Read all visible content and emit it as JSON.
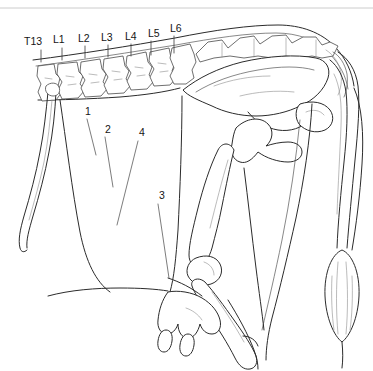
{
  "figure": {
    "background_color": "#ffffff",
    "line_color": "#2b2b2b",
    "width": 373,
    "height": 371
  },
  "vertebra_labels": [
    {
      "id": "t13",
      "text": "T13",
      "x": 24,
      "y": 45,
      "tick_x": 41,
      "tick_y1": 50,
      "tick_y2": 62
    },
    {
      "id": "l1",
      "text": "L1",
      "x": 53,
      "y": 43,
      "tick_x": 62,
      "tick_y1": 48,
      "tick_y2": 60
    },
    {
      "id": "l2",
      "text": "L2",
      "x": 78,
      "y": 42,
      "tick_x": 85,
      "tick_y1": 46,
      "tick_y2": 58
    },
    {
      "id": "l3",
      "text": "L3",
      "x": 101,
      "y": 41,
      "tick_x": 108,
      "tick_y1": 45,
      "tick_y2": 57
    },
    {
      "id": "l4",
      "text": "L4",
      "x": 125,
      "y": 40,
      "tick_x": 131,
      "tick_y1": 44,
      "tick_y2": 56
    },
    {
      "id": "l5",
      "text": "L5",
      "x": 148,
      "y": 37,
      "tick_x": 151,
      "tick_y1": 41,
      "tick_y2": 55
    },
    {
      "id": "l6",
      "text": "L6",
      "x": 170,
      "y": 32,
      "tick_x": 174,
      "tick_y1": 36,
      "tick_y2": 53
    }
  ],
  "numbered_labels": [
    {
      "id": "n1",
      "text": "1",
      "x": 85,
      "y": 115,
      "leader": "M 87 119 L 96 155"
    },
    {
      "id": "n2",
      "text": "2",
      "x": 105,
      "y": 133,
      "leader": "M 105 137 L 113 187"
    },
    {
      "id": "n3",
      "text": "3",
      "x": 159,
      "y": 199,
      "leader": "M 158 204 L 169 278"
    },
    {
      "id": "n4",
      "text": "4",
      "x": 139,
      "y": 136,
      "leader": "M 138 141 L 117 225"
    }
  ],
  "regions": {
    "last_rib": "thirteenth-rib",
    "lumbar_spine": "lumbar-vertebrae",
    "pelvis": "pelvic-girdle",
    "femur": "femur",
    "tibia": "tibia",
    "tail": "tail",
    "tail_switch": "tail-switch",
    "udder": "udder",
    "belly": "ventral-abdominal-contour"
  }
}
